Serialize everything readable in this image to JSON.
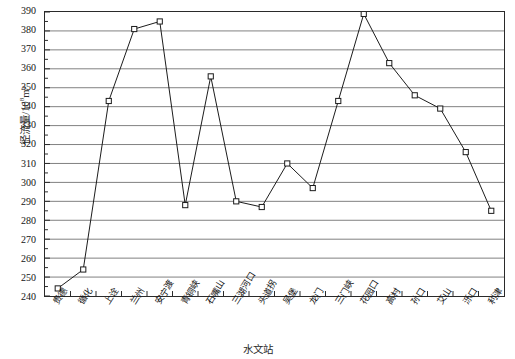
{
  "chart_data": {
    "type": "line",
    "title": "",
    "subtitle": "",
    "xlabel": "水文站",
    "ylabel": "径流量/10⁸m³",
    "ylabel_main": "径流量/10",
    "ylabel_exp": "8",
    "ylabel_unit": "m³",
    "ylim": [
      240,
      390
    ],
    "ytick_step": 10,
    "yticks": [
      390,
      380,
      370,
      360,
      350,
      340,
      330,
      320,
      310,
      300,
      290,
      280,
      270,
      260,
      250,
      240
    ],
    "grid": true,
    "grid_axis": "y",
    "legend": "none",
    "marker": "open-square",
    "line_color": "#1a1a1a",
    "grid_color": "#808080",
    "frame_color": "#2a2a2a",
    "categories": [
      "贵德",
      "循化",
      "上诠",
      "兰州",
      "安宁渡",
      "青铜峡",
      "石嘴山",
      "三湖河口",
      "头道拐",
      "吴堡",
      "龙门",
      "三门峡",
      "花园口",
      "高村",
      "孙口",
      "艾山",
      "泺口",
      "利津"
    ],
    "values": [
      244,
      254,
      343,
      381,
      385,
      288,
      356,
      290,
      287,
      310,
      297,
      343,
      389,
      363,
      346,
      339,
      316,
      285
    ]
  }
}
